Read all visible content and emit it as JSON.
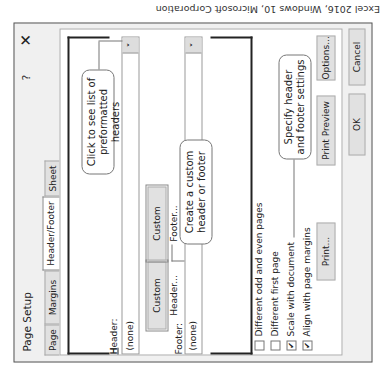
{
  "caption": "Excel 2016, Windows 10, Microsoft Corporation",
  "dialog": {
    "title": "Page Setup",
    "help_label": "?",
    "close_label": "✕",
    "tabs": [
      {
        "label": "Page",
        "selected": false
      },
      {
        "label": "Margins",
        "selected": false
      },
      {
        "label": "Header/Footer",
        "selected": true
      },
      {
        "label": "Sheet",
        "selected": false
      }
    ],
    "header": {
      "label": "Header:",
      "value": "(none)",
      "dropdown_icon": "˅"
    },
    "footer": {
      "label": "Footer:",
      "value": "(none)",
      "dropdown_icon": "˅"
    },
    "buttons": {
      "custom_header": "Custom Header...",
      "custom_footer": "Custom Footer...",
      "print": "Print...",
      "print_preview": "Print Preview",
      "options": "Options...",
      "ok": "OK",
      "cancel": "Cancel"
    },
    "checkboxes": [
      {
        "label": "Different odd and even pages",
        "checked": false
      },
      {
        "label": "Different first page",
        "checked": false
      },
      {
        "label": "Scale with document",
        "checked": true
      },
      {
        "label": "Align with page margins",
        "checked": true
      }
    ],
    "check_glyph": "✔",
    "callouts": {
      "headers_list": "Click to see list of preformatted headers",
      "custom": "Create a custom header or footer",
      "settings": "Specify header and footer settings"
    }
  }
}
